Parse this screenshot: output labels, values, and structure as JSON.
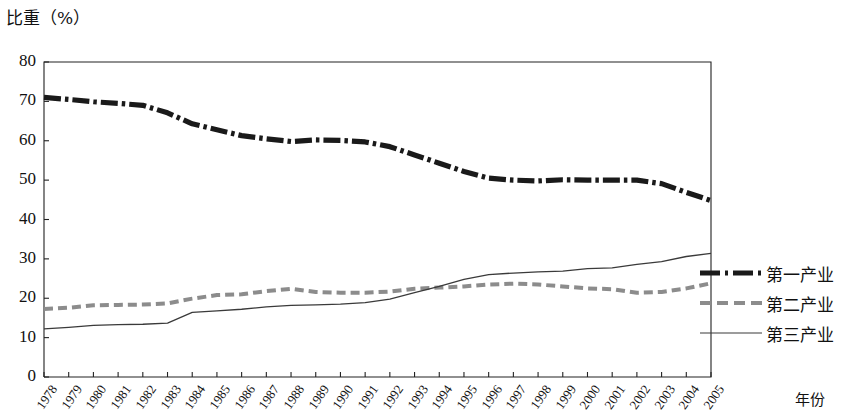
{
  "chart_data": {
    "type": "line",
    "title": "",
    "ylabel": "比重（%）",
    "xlabel": "年份",
    "ylim": [
      0,
      80
    ],
    "ytick_labels": [
      "80",
      "70",
      "60",
      "50",
      "40",
      "30",
      "20",
      "10",
      "0"
    ],
    "ytick_values": [
      80,
      70,
      60,
      50,
      40,
      30,
      20,
      10,
      0
    ],
    "grid": false,
    "legend_position": "right",
    "x": [
      1978,
      1979,
      1980,
      1981,
      1982,
      1983,
      1984,
      1985,
      1986,
      1987,
      1988,
      1989,
      1990,
      1991,
      1992,
      1993,
      1994,
      1995,
      1996,
      1997,
      1998,
      1999,
      2000,
      2001,
      2002,
      2003,
      2004,
      2005
    ],
    "categories": [
      "1978",
      "1979",
      "1980",
      "1981",
      "1982",
      "1983",
      "1984",
      "1985",
      "1986",
      "1987",
      "1988",
      "1989",
      "1990",
      "1991",
      "1992",
      "1993",
      "1994",
      "1995",
      "1996",
      "1997",
      "1998",
      "1999",
      "2000",
      "2001",
      "2002",
      "2003",
      "2004",
      "2005"
    ],
    "series": [
      {
        "name": "第一产业",
        "style": "thick-dash-dot",
        "color": "#1a1a1a",
        "values": [
          71.0,
          70.5,
          69.9,
          69.5,
          69.0,
          67.1,
          64.3,
          62.8,
          61.3,
          60.5,
          59.8,
          60.2,
          60.1,
          59.7,
          58.5,
          56.4,
          54.3,
          52.2,
          50.5,
          50.0,
          49.8,
          50.1,
          50.0,
          50.0,
          50.0,
          49.1,
          46.9,
          44.8
        ]
      },
      {
        "name": "第二产业",
        "style": "dotted-light",
        "color": "#8c8c8c",
        "values": [
          17.3,
          17.6,
          18.2,
          18.3,
          18.4,
          18.7,
          19.9,
          20.8,
          21.0,
          21.8,
          22.4,
          21.6,
          21.4,
          21.4,
          21.7,
          22.4,
          22.7,
          23.0,
          23.5,
          23.7,
          23.5,
          23.0,
          22.5,
          22.3,
          21.4,
          21.6,
          22.5,
          23.8
        ]
      },
      {
        "name": "第三产业",
        "style": "thin-solid",
        "color": "#3a3a3a",
        "values": [
          12.2,
          12.6,
          13.1,
          13.3,
          13.4,
          13.7,
          16.4,
          16.8,
          17.2,
          17.8,
          18.2,
          18.3,
          18.5,
          18.9,
          19.8,
          21.4,
          23.0,
          24.8,
          26.0,
          26.4,
          26.7,
          26.9,
          27.5,
          27.7,
          28.6,
          29.3,
          30.6,
          31.4
        ]
      }
    ]
  }
}
